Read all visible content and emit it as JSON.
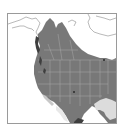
{
  "map": {
    "title": "",
    "type": "species range map",
    "region": "North America",
    "colors": {
      "background": "#ffffff",
      "frame": "#9a9a9a",
      "coastline": "#8a8a8a",
      "range_fill": "#787878",
      "range_dark": "#3e3e3e",
      "boundaries": "#a8a8a8",
      "water_light": "#dcdcdc"
    },
    "legend": []
  }
}
